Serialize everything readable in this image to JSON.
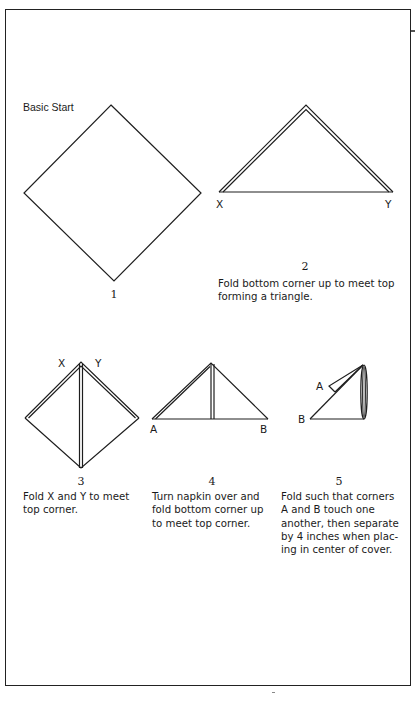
{
  "title": "Basic Start",
  "steps": [
    {
      "number": "1",
      "caption_lines": [],
      "labels": []
    },
    {
      "number": "2",
      "caption_lines": [
        "Fold bottom corner up to meet top",
        "forming a triangle."
      ],
      "labels": [
        "X",
        "Y"
      ]
    },
    {
      "number": "3",
      "caption_lines": [
        "Fold X and Y to meet",
        "top corner."
      ],
      "labels": [
        "X",
        "Y"
      ]
    },
    {
      "number": "4",
      "caption_lines": [
        "Turn napkin over and",
        "fold bottom corner up",
        "to meet top corner."
      ],
      "labels": [
        "A",
        "B"
      ]
    },
    {
      "number": "5",
      "caption_lines": [
        "Fold such that corners",
        "A and B touch one",
        "another, then separate",
        "by 4 inches when plac-",
        "ing in center of cover."
      ],
      "labels": [
        "A",
        "B"
      ]
    }
  ],
  "colors": {
    "line": "#1e1e1e",
    "text": "#1a1a1a",
    "background": "#ffffff"
  }
}
